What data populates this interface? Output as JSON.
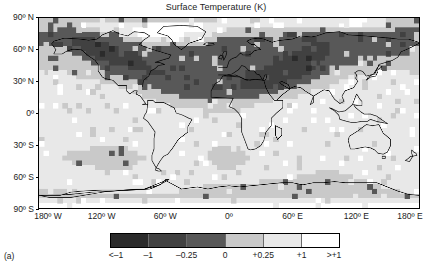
{
  "figure": {
    "title": "Surface Temperature (K)",
    "panel_label": "(a)"
  },
  "axes": {
    "y_ticks": [
      {
        "label": "90º N",
        "value": 90
      },
      {
        "label": "60º N",
        "value": 60
      },
      {
        "label": "30º N",
        "value": 30
      },
      {
        "label": "0º",
        "value": 0
      },
      {
        "label": "30º S",
        "value": -30
      },
      {
        "label": "60º S",
        "value": -60
      },
      {
        "label": "90º S",
        "value": -90
      }
    ],
    "x_ticks": [
      {
        "label": "180º W",
        "value": -180
      },
      {
        "label": "120º W",
        "value": -120
      },
      {
        "label": "60º W",
        "value": -60
      },
      {
        "label": "0º",
        "value": 0
      },
      {
        "label": "60º E",
        "value": 60
      },
      {
        "label": "120º E",
        "value": 120
      },
      {
        "label": "180º E",
        "value": 180
      }
    ]
  },
  "colorbar": {
    "boundary_labels": [
      "<–1",
      "–1",
      "–0.25",
      "0",
      "+0.25",
      "+1",
      ">+1"
    ],
    "segments": [
      {
        "label": "<-1 to -1",
        "color": "#2b2b2b"
      },
      {
        "label": "-1 to -0.25",
        "color": "#414141"
      },
      {
        "label": "-0.25 to 0",
        "color": "#585858"
      },
      {
        "label": "0 to +0.25",
        "color": "#c9c9c9"
      },
      {
        "label": "+0.25 to +1",
        "color": "#e8e8e8"
      },
      {
        "label": "+1 to >+1",
        "color": "#ffffff"
      }
    ]
  },
  "chart_data": {
    "type": "heatmap",
    "title": "Surface Temperature (K)",
    "xlabel": "",
    "ylabel": "",
    "projection": "equirectangular",
    "xlim": [
      -180,
      180
    ],
    "ylim": [
      -90,
      90
    ],
    "grid": false,
    "legend_position": "bottom",
    "cell_degrees": {
      "lon": 5,
      "lat": 5
    },
    "value_units": "K",
    "colorbar_levels": [
      -1,
      -0.25,
      0,
      0.25,
      1
    ],
    "level_colors": [
      "#2b2b2b",
      "#414141",
      "#585858",
      "#c9c9c9",
      "#e8e8e8",
      "#ffffff"
    ],
    "band_means_by_latitude": [
      {
        "lat_band": "80N-90N",
        "value": 0.45
      },
      {
        "lat_band": "70N-80N",
        "value": 0.3
      },
      {
        "lat_band": "60N-70N",
        "value": -0.4
      },
      {
        "lat_band": "50N-60N",
        "value": -0.6
      },
      {
        "lat_band": "40N-50N",
        "value": -0.55
      },
      {
        "lat_band": "30N-40N",
        "value": -0.45
      },
      {
        "lat_band": "20N-30N",
        "value": -0.15
      },
      {
        "lat_band": "10N-20N",
        "value": 0.1
      },
      {
        "lat_band": "0-10N",
        "value": 0.15
      },
      {
        "lat_band": "10S-0",
        "value": 0.15
      },
      {
        "lat_band": "20S-10S",
        "value": 0.1
      },
      {
        "lat_band": "30S-20S",
        "value": -0.1
      },
      {
        "lat_band": "40S-30S",
        "value": -0.2
      },
      {
        "lat_band": "50S-40S",
        "value": -0.15
      },
      {
        "lat_band": "60S-50S",
        "value": -0.3
      },
      {
        "lat_band": "70S-60S",
        "value": 0.2
      },
      {
        "lat_band": "80S-70S",
        "value": 0.4
      },
      {
        "lat_band": "90S-80S",
        "value": 0.35
      }
    ],
    "grid_rows": [
      "333333333333333333333333333333333333334444444444444444444444444555555544443333333",
      "333333333444444444444445555555555554444444444444444444444444444455555444443333333",
      "333322222333344444445555555555555554444433333333333333333333333333333333333322222",
      "222222222222233334444555555555544444433333333333333322222222222222222222222222222",
      "222222211111222222333344444455544443333222222222222222222222222222222222222222222",
      "222222211111111222222233333333333333222222222222222222222211112222222222222222222",
      "333333222111111112222222222222222222222222222222222222221111112222222222222222233",
      "333333322211111111112222222222222222222222222222222222111111112222222222222222233",
      "333333332222111111111122222222222222222222222222222211111111122222222222333333333",
      "333333333322222111111112222222222222222222222222221111111111222222223333333333333",
      "333333333333322222211111222222222222222222222222111111111112222233333333333333333",
      "334444333333332222222221111222222222222222221111111111111122223333333333444444433",
      "444444443333333333222222222222222222222222221111111111112222333333334444444444444",
      "444444444444433333333222222222222222222222211111111112222233333334444444444444444",
      "444444444444444443333333222222222222222222211111112222233333334444444444444444444",
      "444444444444444444443333332222222222222222222222222333333344444444444444444444444",
      "444444444444444444444433333333222222222222222223333333444444444444444444444444444",
      "444444444444444444444444433333333333333333333333334444444444444444444444444444444",
      "444444444444444444444444444433333333333333333334444444444444444444444444444444444",
      "444444444444444444444444444444444443333333344444444444444444444444444444444444444",
      "444444444444444444444444444444444444444444444444444444444444444444444444444444444",
      "444444444444444444444444444444444444444444444444444444444444444444444444444444444",
      "444444444444444444444444444444444444444444444444444444444444444444444444444444444",
      "444444444444444444444444444444444444444444444444444444444444444444444444444444444",
      "444444444444444444444444444444444444444444444444444444444444444444444444444444444",
      "444444444444444444444444444444444444444444444444444444444444444444444444444444444",
      "444444444444444444444444444444444444444444444444444444444444444444444444444444444",
      "444444444443333333344444444444444444433333344444444444444444444444444444444444444",
      "444444333333333333333444444444444444333333334444444444444444444444444444444444444",
      "444443333333333333333334444444444444333333333444444444444444444444444444444444444",
      "444444433333333333333344444444444444433333334444444444444444444444444444444444444",
      "444444444444333333334444444444444444443333444444444444444444444444444444444444444",
      "444444444444444444444444444444444444444444444444444444444443333344444444444444444",
      "444444444444444444444444444444444444444444444444444444433333333333344444444444444",
      "444444444444444444444444444444444444444444444443333333333333333333333344444444444",
      "444444444444444444444444444444444443333333333333333333333333333333333333344444444",
      "333333444444444444444444444444333333333333333333333333333333333333333333333334444",
      "333333333333333333333333333333333333333333333333333333333333333333333333333333333",
      "444444444444444444444444444444444444444444444444444444444444444444444444444444444",
      "555555555555555555555555555555555555555555555555555555555555555555555555555555555"
    ],
    "grid_legend": {
      "0": "<-1 (darkest)",
      "1": "-1 to -0.25",
      "2": "-0.25 to 0",
      "3": "0 to +0.25",
      "4": "+0.25 to +1",
      "5": ">+1 (white)"
    }
  },
  "coastlines_note": "Black coastline outlines overlaid on the shaded anomaly field."
}
